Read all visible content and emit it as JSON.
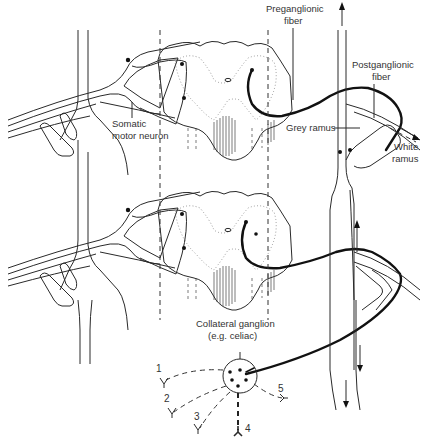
{
  "figure": {
    "type": "diagram"
  },
  "labels": {
    "preganglionic": [
      "Preganglionic",
      "fiber"
    ],
    "postganglionic": [
      "Postganglionic",
      "fiber"
    ],
    "somatic": [
      "Somatic",
      "motor neuron"
    ],
    "grey_ramus": "Grey ramus",
    "white_ramus": [
      "White",
      "ramus"
    ],
    "collateral": [
      "Collateral ganglion",
      "(e.g. celiac)"
    ]
  },
  "targets": [
    "1",
    "2",
    "3",
    "4",
    "5"
  ],
  "colors": {
    "line": "#2a2a2a",
    "fiber": "#111111",
    "background": "#ffffff"
  }
}
